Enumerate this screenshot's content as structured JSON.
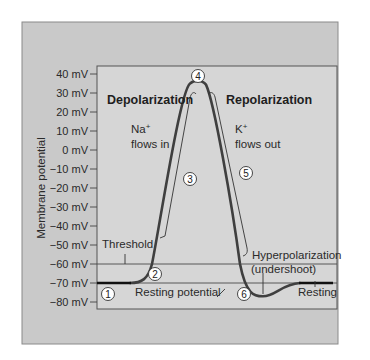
{
  "figure": {
    "axis_title": "Membrane potential",
    "y_ticks": [
      "40 mV",
      "30 mV",
      "20 mV",
      "10 mV",
      "0 mV",
      "−10 mV",
      "−20 mV",
      "−30 mV",
      "−40 mV",
      "−50 mV",
      "−60 mV",
      "−70 mV",
      "−80 mV"
    ],
    "y_range_mV": [
      -80,
      40
    ],
    "threshold_mV": -60,
    "resting_mV": -70,
    "phases": {
      "depolarization": "Depolarization",
      "repolarization": "Repolarization"
    },
    "ions": {
      "na_line1": "Na",
      "na_sup": "+",
      "na_line2": "flows in",
      "k_line1": "K",
      "k_sup": "+",
      "k_line2": "flows out"
    },
    "labels": {
      "threshold": "Threshold",
      "resting_potential": "Resting potential",
      "hyperpolarization": "Hyperpolarization",
      "undershoot": "(undershoot)",
      "resting": "Resting"
    },
    "steps": [
      "1",
      "2",
      "3",
      "4",
      "5",
      "6"
    ],
    "colors": {
      "outer_bg": "#c9c9c9",
      "plot_bg": "#d6d6d6",
      "curve": "#3f3f3f",
      "resting_segment": "#111111"
    }
  }
}
